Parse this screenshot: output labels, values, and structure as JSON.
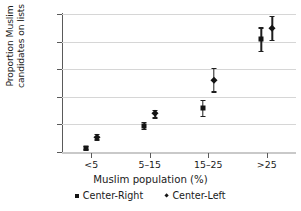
{
  "chart_data": {
    "type": "scatter",
    "title": "",
    "xlabel": "Muslim population (%)",
    "ylabel_line1": "Proportion Muslim",
    "ylabel_line2": "candidates on lists",
    "categories": [
      "<5",
      "5–15",
      "15–25",
      ">25"
    ],
    "ylim": [
      0,
      0.25
    ],
    "yticks": [
      "0",
      "0.05",
      "0.1",
      "0.15",
      "0.2",
      "0.25"
    ],
    "ytick_values": [
      0,
      0.05,
      0.1,
      0.15,
      0.2,
      0.25
    ],
    "grid": true,
    "legend_position": "below",
    "series": [
      {
        "name": "Center-Right",
        "marker": "square",
        "values": [
          0.008,
          0.048,
          0.08,
          0.204
        ],
        "err_low": [
          0.005,
          0.042,
          0.066,
          0.183
        ],
        "err_high": [
          0.011,
          0.055,
          0.094,
          0.226
        ]
      },
      {
        "name": "Center-Left",
        "marker": "diamond",
        "values": [
          0.028,
          0.07,
          0.131,
          0.225
        ],
        "err_low": [
          0.023,
          0.063,
          0.11,
          0.203
        ],
        "err_high": [
          0.033,
          0.077,
          0.152,
          0.247
        ]
      }
    ]
  },
  "legend": {
    "items": [
      {
        "label": "Center-Right",
        "marker": "square"
      },
      {
        "label": "Center-Left",
        "marker": "diamond"
      }
    ]
  },
  "colors": {
    "marker": "#141414",
    "gridline": "#d6d6d6",
    "axis": "#5a5a5a",
    "text": "#1a1a1a",
    "background": "#ffffff"
  }
}
